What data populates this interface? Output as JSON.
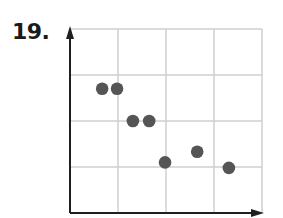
{
  "problem": {
    "number": "19."
  },
  "colors": {
    "grid": "#cfcfcf",
    "axis": "#1f1f1f",
    "point": "#555555"
  },
  "chart_data": {
    "type": "scatter",
    "title": "",
    "xlabel": "",
    "ylabel": "",
    "xlim": [
      0,
      4
    ],
    "ylim": [
      0,
      4
    ],
    "grid": true,
    "grid_cells": {
      "columns": 4,
      "rows": 4
    },
    "tick_labels": {
      "x": [],
      "y": []
    },
    "legend": null,
    "points": [
      {
        "x": 0.67,
        "y": 2.7
      },
      {
        "x": 0.98,
        "y": 2.7
      },
      {
        "x": 1.31,
        "y": 2.0
      },
      {
        "x": 1.65,
        "y": 2.0
      },
      {
        "x": 1.98,
        "y": 1.1
      },
      {
        "x": 2.65,
        "y": 1.33
      },
      {
        "x": 3.31,
        "y": 0.98
      }
    ]
  },
  "plot_area": {
    "x0": 70,
    "y0": 213,
    "width": 192,
    "height": 184
  }
}
